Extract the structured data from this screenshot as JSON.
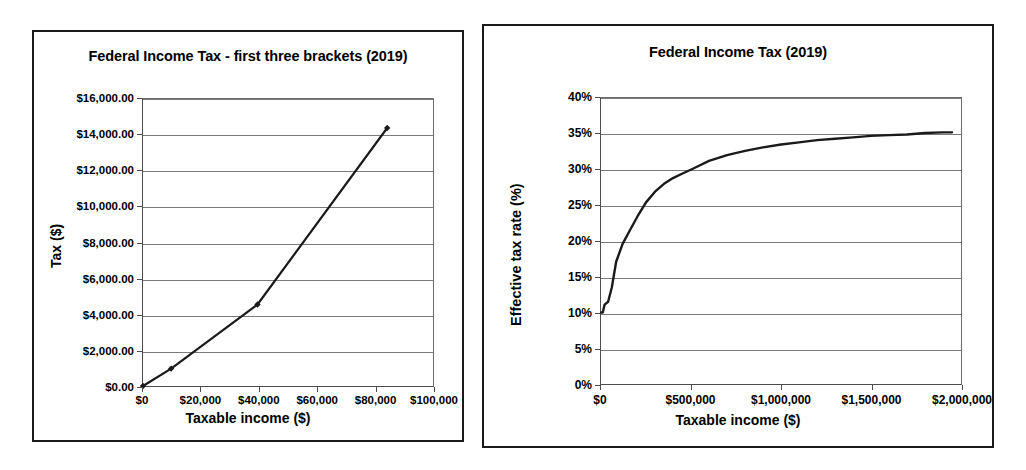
{
  "chart_data": [
    {
      "type": "line",
      "title": "Federal Income Tax - first three brackets (2019)",
      "xlabel": "Taxable income ($)",
      "ylabel": "Tax ($)",
      "xlim": [
        0,
        100000
      ],
      "ylim": [
        0,
        16000
      ],
      "grid": true,
      "legend": "none",
      "markers": true,
      "xticks": [
        "$0",
        "$20,000",
        "$40,000",
        "$60,000",
        "$80,000",
        "$100,000"
      ],
      "xtickvalues": [
        0,
        20000,
        40000,
        60000,
        80000,
        100000
      ],
      "yticks": [
        "$0.00",
        "$2,000.00",
        "$4,000.00",
        "$6,000.00",
        "$8,000.00",
        "$10,000.00",
        "$12,000.00",
        "$14,000.00",
        "$16,000.00"
      ],
      "ytickvalues": [
        0,
        2000,
        4000,
        6000,
        8000,
        10000,
        12000,
        14000,
        16000
      ],
      "x": [
        0,
        9700,
        39475,
        84200
      ],
      "y": [
        0,
        970,
        4543,
        14382.5
      ]
    },
    {
      "type": "line",
      "title": "Federal Income Tax (2019)",
      "xlabel": "Taxable income ($)",
      "ylabel": "Effective tax rate (%)",
      "xlim": [
        0,
        2000000
      ],
      "ylim": [
        0,
        40
      ],
      "grid": true,
      "legend": "none",
      "markers": false,
      "xticks": [
        "$0",
        "$500,000",
        "$1,000,000",
        "$1,500,000",
        "$2,000,000"
      ],
      "xtickvalues": [
        0,
        500000,
        1000000,
        1500000,
        2000000
      ],
      "yticks": [
        "0%",
        "5%",
        "10%",
        "15%",
        "20%",
        "25%",
        "30%",
        "35%",
        "40%"
      ],
      "ytickvalues": [
        0,
        5,
        10,
        15,
        20,
        25,
        30,
        35,
        40
      ],
      "x": [
        1000,
        9700,
        20000,
        39475,
        60000,
        84200,
        120000,
        160725,
        204100,
        250000,
        300000,
        350000,
        400000,
        450000,
        510300,
        600000,
        700000,
        800000,
        900000,
        1000000,
        1100000,
        1200000,
        1300000,
        1400000,
        1500000,
        1600000,
        1700000,
        1800000,
        1900000,
        1950000
      ],
      "y": [
        10.0,
        10.0,
        11.1,
        11.5,
        13.5,
        17.1,
        19.6,
        21.5,
        23.5,
        25.4,
        26.9,
        28.0,
        28.8,
        29.4,
        30.1,
        31.2,
        32.0,
        32.6,
        33.1,
        33.5,
        33.8,
        34.1,
        34.3,
        34.5,
        34.7,
        34.8,
        34.9,
        35.1,
        35.2,
        35.2
      ]
    }
  ],
  "colors": {
    "panel_border": "#1a1a1a",
    "axis": "#4d4d4d",
    "gridline": "#7a7a7a",
    "series": "#1a1a1a",
    "background": "#ffffff"
  }
}
